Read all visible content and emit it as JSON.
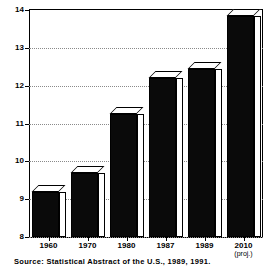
{
  "chart_data": {
    "type": "bar",
    "title": "",
    "subtitle": "",
    "xlabel": "",
    "ylabel": "",
    "categories": [
      "1960",
      "1970",
      "1980",
      "1987",
      "1989",
      "2010"
    ],
    "category_sublabels": [
      "",
      "",
      "",
      "",
      "",
      "(proj.)"
    ],
    "values": [
      9.2,
      9.7,
      11.25,
      12.2,
      12.45,
      13.85
    ],
    "ylim": [
      8,
      14
    ],
    "ytick_labels": [
      "8",
      "9",
      "10",
      "11",
      "12",
      "13",
      "14"
    ],
    "ytick_values": [
      8,
      9,
      10,
      11,
      12,
      13,
      14
    ],
    "grid": true,
    "grid_axis": "y",
    "legend": false,
    "legend_position": "none",
    "bar_style": "3d-block",
    "bar_face_color": "#0a0a0a",
    "bar_side_color": "#ffffff",
    "bar_edge_color": "#000000",
    "background_color": "#ffffff",
    "series": [
      {
        "name": "",
        "values": [
          9.2,
          9.7,
          11.25,
          12.2,
          12.45,
          13.85
        ]
      }
    ]
  },
  "footer": {
    "source_note": "Source:  Statistical Abstract of the U.S., 1989, 1991."
  }
}
